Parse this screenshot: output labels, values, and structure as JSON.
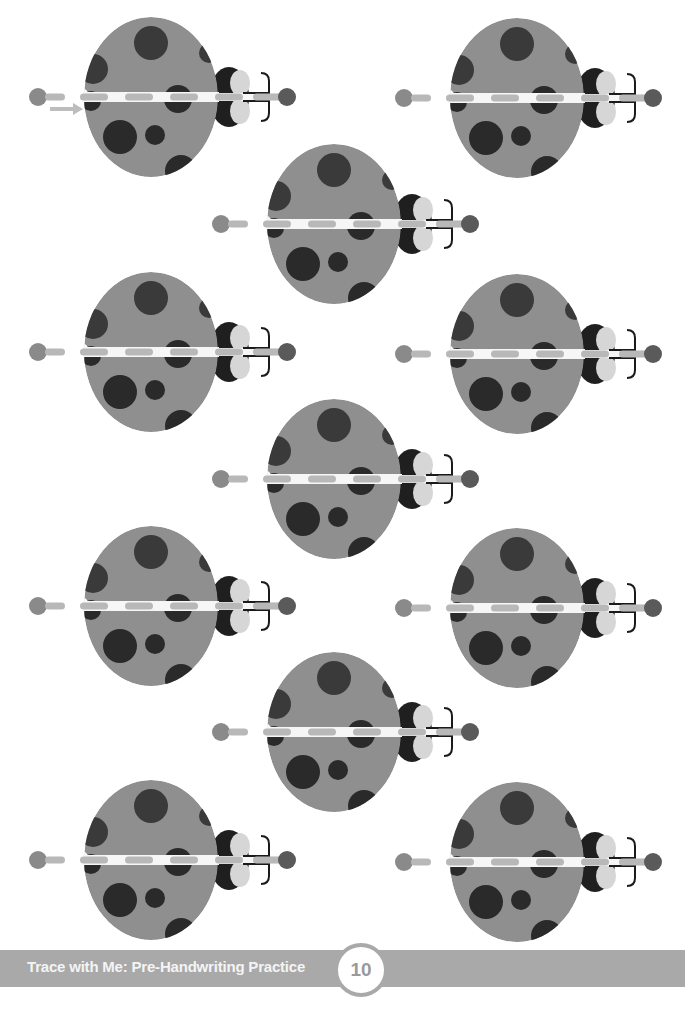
{
  "page": {
    "footer": {
      "title": "Trace with Me: Pre-Handwriting Practice",
      "page_number": "10"
    },
    "colors": {
      "body": "#8f8f8f",
      "spot": "#2a2a2a",
      "spot_mid": "#3a3a3a",
      "head": "#1f1f1f",
      "cheek": "#d6d6d6",
      "stripe": "#f6f6f6",
      "dash": "#b8b8b8",
      "start_dot": "#8a8a8a",
      "nose": "#5a5a5a",
      "antenna": "#1a1a1a",
      "arrow": "#bdbdbd",
      "footer_bar": "#a9a9a9"
    },
    "ladybugs": [
      {
        "id": "ladybug-1",
        "cx": 151,
        "cy": 97,
        "has_arrow": true
      },
      {
        "id": "ladybug-2",
        "cx": 517,
        "cy": 98,
        "has_arrow": false
      },
      {
        "id": "ladybug-3",
        "cx": 334,
        "cy": 224,
        "has_arrow": false
      },
      {
        "id": "ladybug-4",
        "cx": 151,
        "cy": 352,
        "has_arrow": false
      },
      {
        "id": "ladybug-5",
        "cx": 517,
        "cy": 354,
        "has_arrow": false
      },
      {
        "id": "ladybug-6",
        "cx": 334,
        "cy": 479,
        "has_arrow": false
      },
      {
        "id": "ladybug-7",
        "cx": 151,
        "cy": 606,
        "has_arrow": false
      },
      {
        "id": "ladybug-8",
        "cx": 517,
        "cy": 608,
        "has_arrow": false
      },
      {
        "id": "ladybug-9",
        "cx": 334,
        "cy": 732,
        "has_arrow": false
      },
      {
        "id": "ladybug-10",
        "cx": 151,
        "cy": 860,
        "has_arrow": false
      },
      {
        "id": "ladybug-11",
        "cx": 517,
        "cy": 862,
        "has_arrow": false
      }
    ]
  }
}
